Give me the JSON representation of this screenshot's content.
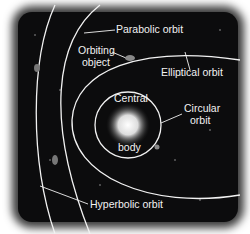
{
  "diagram": {
    "labels": {
      "parabolic": "Parabolic orbit",
      "orbiting_line1": "Orbiting",
      "orbiting_line2": "object",
      "elliptical": "Elliptical orbit",
      "central_line1": "Central",
      "central_line2": "body",
      "circular_line1": "Circular",
      "circular_line2": "orbit",
      "hyperbolic": "Hyperbolic orbit"
    },
    "colors": {
      "background": "#0c0c0d",
      "lines": "#f2f2f2",
      "frame_glow": "#3a3a3a"
    }
  }
}
